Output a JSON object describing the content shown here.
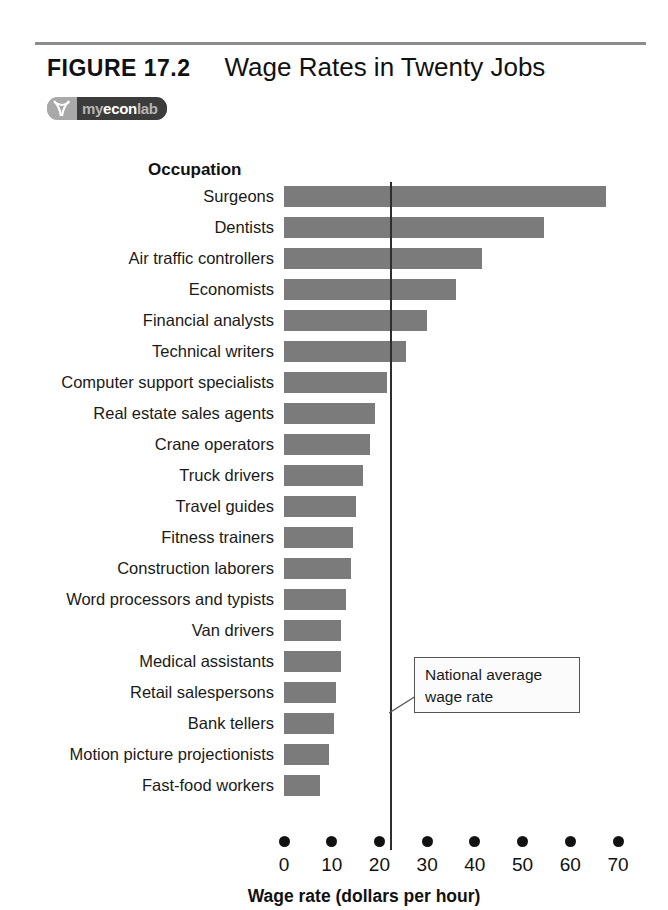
{
  "figure": {
    "number": "FIGURE  17.2",
    "title": "Wage Rates in Twenty Jobs",
    "badge": {
      "mark": "myeconlab-logo-icon",
      "my": "my",
      "econ": "econ",
      "lab": "lab"
    }
  },
  "annotation": {
    "line1": "National average",
    "line2": "wage rate"
  },
  "chart_data": {
    "type": "bar",
    "orientation": "horizontal",
    "title": "Wage Rates in Twenty Jobs",
    "xlabel": "Wage rate (dollars per hour)",
    "ylabel": "Occupation",
    "xlim": [
      0,
      70
    ],
    "xticks": [
      0,
      10,
      20,
      30,
      40,
      50,
      60,
      70
    ],
    "xtick_labels": [
      "0",
      "10",
      "20",
      "30",
      "40",
      "50",
      "60",
      "70"
    ],
    "grid": false,
    "legend": null,
    "bar_color": "#7b7b7b",
    "categories": [
      "Surgeons",
      "Dentists",
      "Air traffic controllers",
      "Economists",
      "Financial analysts",
      "Technical writers",
      "Computer support specialists",
      "Real estate sales agents",
      "Crane operators",
      "Truck drivers",
      "Travel guides",
      "Fitness trainers",
      "Construction laborers",
      "Word processors and typists",
      "Van drivers",
      "Medical assistants",
      "Retail salespersons",
      "Bank tellers",
      "Motion picture projectionists",
      "Fast-food workers"
    ],
    "values": [
      67.5,
      54.5,
      41.5,
      36,
      30,
      25.5,
      21.5,
      19,
      18,
      16.5,
      15,
      14.5,
      14,
      13,
      12,
      12,
      11,
      10.5,
      9.5,
      7.5
    ],
    "annotations": [
      {
        "text": "National average wage rate",
        "type": "vline",
        "x": 22.2,
        "color": "#2e2e2e"
      }
    ]
  }
}
